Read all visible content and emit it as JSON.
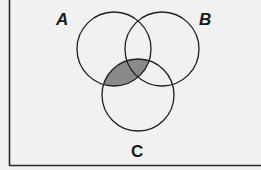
{
  "diagram": {
    "type": "venn",
    "sets": [
      {
        "id": "A",
        "label": "A",
        "cx": 114,
        "cy": 49,
        "r": 37
      },
      {
        "id": "B",
        "label": "B",
        "cx": 162,
        "cy": 49,
        "r": 37
      },
      {
        "id": "C",
        "label": "C",
        "cx": 138,
        "cy": 95,
        "r": 36
      }
    ],
    "shaded_region": "A ∩ C",
    "colors": {
      "background": "#f1f1f1",
      "stroke": "#1f1f1f",
      "shade": "#8a8a8a",
      "frame": "#2a2a2a"
    }
  }
}
